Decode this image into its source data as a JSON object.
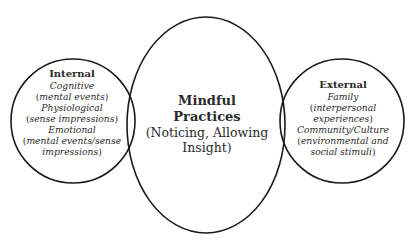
{
  "diagram": {
    "type": "venn",
    "stroke_color": "#1a1a1a",
    "left": {
      "title": "Internal",
      "items": [
        {
          "label": "Cognitive",
          "detail": "mental events"
        },
        {
          "label": "Physiological",
          "detail": "sense impressions"
        },
        {
          "label": "Emotional",
          "detail": "mental events/sense",
          "detail_cont": "impressions"
        }
      ]
    },
    "center": {
      "title_line1": "Mindful",
      "title_line2": "Practices",
      "subtitle_line1": "(Noticing, Allowing",
      "subtitle_line2": "Insight)"
    },
    "right": {
      "title": "External",
      "items": [
        {
          "label": "Family",
          "detail": "interpersonal",
          "detail_cont": "experiences"
        },
        {
          "label": "Community/Culture",
          "detail": "environmental and",
          "detail_cont": "social stimuli"
        }
      ]
    }
  }
}
